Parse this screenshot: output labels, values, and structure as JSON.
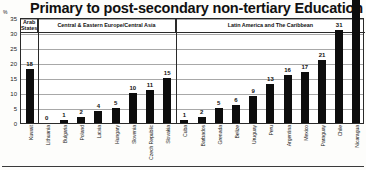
{
  "chart_data": {
    "type": "bar",
    "title": "Primary to post-secondary non-tertiary Education",
    "xlabel": "",
    "ylabel": "%",
    "ylim": [
      0,
      35
    ],
    "yticks": [
      0,
      5,
      10,
      15,
      20,
      25,
      30,
      35
    ],
    "grid": true,
    "legend": "none",
    "categories": [
      "Kuwait",
      "Lithuania",
      "Bulgaria",
      "Poland",
      "Latvia",
      "Hungary",
      "Slovenia",
      "Czech Republic",
      "Slovakia",
      "Cuba",
      "Barbados",
      "Grenada",
      "Belize",
      "Uruguay",
      "Peru",
      "Argentina",
      "Mexico",
      "Paraguay",
      "Chile",
      "Nicaragua"
    ],
    "values": [
      18,
      0,
      1,
      2,
      4,
      5,
      10,
      11,
      15,
      1,
      2,
      5,
      6,
      9,
      13,
      16,
      17,
      21,
      31,
      48
    ],
    "groups": [
      {
        "label": "Arab States",
        "start": 0,
        "count": 1
      },
      {
        "label": "Central & Eastern Europe/Central Asia",
        "start": 1,
        "count": 8
      },
      {
        "label": "Latin America and The Caribbean",
        "start": 9,
        "count": 11
      }
    ],
    "bar_color": "#0d0d0d",
    "grid_color": "#a8a8a8",
    "axis_color": "#2a2a2a"
  }
}
